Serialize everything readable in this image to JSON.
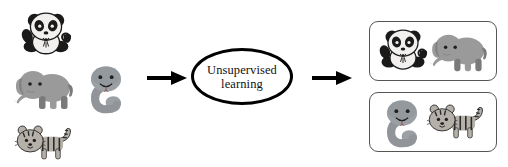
{
  "figure": {
    "type": "flow-diagram",
    "background_color": "#ffffff",
    "width": 508,
    "height": 167
  },
  "input_cluster": {
    "name": "unlabeled-animal-images",
    "animals": [
      {
        "id": "panda",
        "label": "panda",
        "x": 20,
        "y": 8,
        "w": 52,
        "h": 52,
        "body_color": "#f2f0ee",
        "accent_color": "#1a1a1a"
      },
      {
        "id": "elephant",
        "label": "elephant",
        "x": 12,
        "y": 63,
        "w": 66,
        "h": 50,
        "body_color": "#9a9a9a",
        "accent_color": "#7a7a7a"
      },
      {
        "id": "snake",
        "label": "snake",
        "x": 84,
        "y": 62,
        "w": 44,
        "h": 52,
        "body_color": "#9ba0a4",
        "accent_color": "#7d8287"
      },
      {
        "id": "tiger",
        "label": "tiger",
        "x": 14,
        "y": 120,
        "w": 62,
        "h": 44,
        "body_color": "#b5b0a8",
        "accent_color": "#2b2b2b"
      }
    ]
  },
  "arrows": [
    {
      "id": "arrow-input-to-process",
      "x": 147,
      "y": 70,
      "w": 40,
      "h": 16,
      "color": "#000000"
    },
    {
      "id": "arrow-process-to-output",
      "x": 312,
      "y": 70,
      "w": 40,
      "h": 16,
      "color": "#000000"
    }
  ],
  "process": {
    "name": "unsupervised-learning",
    "label": "Unsupervised\nlearning",
    "line1": "Unsupervised",
    "line2": "learning",
    "border_color": "#000000",
    "fill_color": "#ffffff"
  },
  "output_groups": [
    {
      "id": "cluster-1",
      "border_color": "#555555",
      "animals": [
        {
          "id": "panda",
          "label": "panda",
          "x": 8,
          "y": 3,
          "w": 50,
          "h": 50,
          "body_color": "#f2f0ee",
          "accent_color": "#1a1a1a"
        },
        {
          "id": "elephant",
          "label": "elephant",
          "x": 58,
          "y": 5,
          "w": 64,
          "h": 48,
          "body_color": "#9a9a9a",
          "accent_color": "#7a7a7a"
        }
      ]
    },
    {
      "id": "cluster-2",
      "border_color": "#555555",
      "animals": [
        {
          "id": "snake",
          "label": "snake",
          "x": 10,
          "y": 3,
          "w": 44,
          "h": 52,
          "body_color": "#9ba0a4",
          "accent_color": "#7d8287"
        },
        {
          "id": "tiger",
          "label": "tiger",
          "x": 56,
          "y": 6,
          "w": 62,
          "h": 44,
          "body_color": "#b5b0a8",
          "accent_color": "#2b2b2b"
        }
      ]
    }
  ]
}
